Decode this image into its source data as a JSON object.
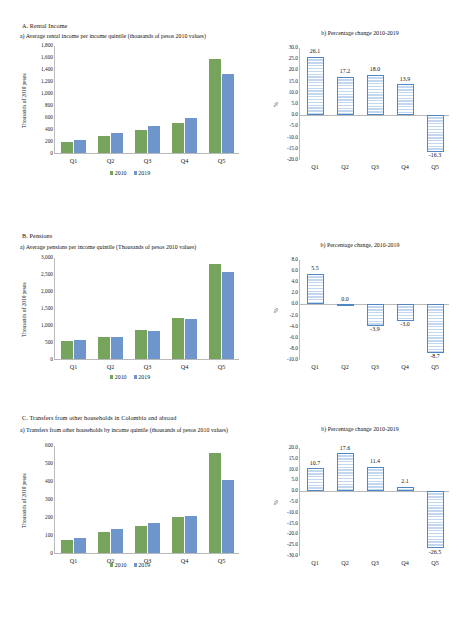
{
  "document": {
    "sections": [
      {
        "id": "rental-income",
        "heading": "A. Rental Income",
        "left_panel_title": "a) Average rental income per income quintile (thousands of pesos 2010 values)",
        "right_panel_title": "b) Percentage change 2010-2019",
        "legend": {
          "series1": "2010",
          "series2": "2019"
        }
      },
      {
        "id": "pensions",
        "heading": "B. Pensions",
        "left_panel_title": "a) Average pensions per income quintile (Thousands of pesos 2010 values)",
        "right_panel_title": "b) Percentage change, 2010-2019",
        "legend": {
          "series1": "2010",
          "series2": "2019"
        }
      },
      {
        "id": "transfers",
        "heading": "C. Transfers from other households in Colombia and abroad",
        "left_panel_title": "a) Transfers from other households by income quintile (thousands of pesos 2010 values)",
        "right_panel_title": "b) Percentage change 2010-2019",
        "legend": {
          "series1": "2010",
          "series2": "2019"
        }
      }
    ]
  },
  "colors": {
    "series_2010": "#76a45c",
    "series_2019": "#6e95cc",
    "pct_bar_border": "#4f86c6",
    "pct_bar_fill": "#eaf1fa",
    "axis": "#b9b9b9"
  },
  "chart_data": [
    {
      "id": "A-a",
      "type": "bar",
      "title": "a) Average rental income per income quintile (thousands of pesos 2010 values)",
      "xlabel": "",
      "ylabel": "Thousands of 2010 pesos",
      "categories": [
        "Q1",
        "Q2",
        "Q3",
        "Q4",
        "Q5"
      ],
      "series": [
        {
          "name": "2010",
          "values": [
            178,
            285,
            378,
            505,
            1560
          ]
        },
        {
          "name": "2019",
          "values": [
            225,
            335,
            448,
            578,
            1310
          ]
        }
      ],
      "ylim": [
        0,
        1800
      ],
      "yticks": [
        "0",
        "200",
        "400",
        "600",
        "800",
        "1,000",
        "1,200",
        "1,400",
        "1,600",
        "1,800"
      ],
      "grid": false,
      "legend_position": "bottom"
    },
    {
      "id": "A-b",
      "type": "bar",
      "title": "b) Percentage change 2010-2019",
      "xlabel": "",
      "ylabel": "%",
      "categories": [
        "Q1",
        "Q2",
        "Q3",
        "Q4",
        "Q5"
      ],
      "values": [
        26.1,
        17.2,
        18.0,
        13.9,
        -16.3
      ],
      "data_labels": [
        "26.1",
        "17.2",
        "18.0",
        "13.9",
        "-16.3"
      ],
      "ylim": [
        -20.0,
        30.0
      ],
      "yticks": [
        "30.0",
        "25.0",
        "20.0",
        "15.0",
        "10.0",
        "5.0",
        "0.0",
        "-5.0",
        "-10.0",
        "-15.0",
        "-20.0"
      ],
      "grid": false,
      "legend_position": "none"
    },
    {
      "id": "B-a",
      "type": "bar",
      "title": "a) Average pensions per income quintile (Thousands of pesos 2010 values)",
      "xlabel": "",
      "ylabel": "Thousands of 2010 pesos",
      "categories": [
        "Q1",
        "Q2",
        "Q3",
        "Q4",
        "Q5"
      ],
      "series": [
        {
          "name": "2010",
          "values": [
            530,
            660,
            850,
            1210,
            2790
          ]
        },
        {
          "name": "2019",
          "values": [
            560,
            660,
            815,
            1175,
            2545
          ]
        }
      ],
      "ylim": [
        0,
        3000
      ],
      "yticks": [
        "0",
        "500",
        "1,000",
        "1,500",
        "2,000",
        "2,500",
        "3,000"
      ],
      "grid": false,
      "legend_position": "bottom"
    },
    {
      "id": "B-b",
      "type": "bar",
      "title": "b) Percentage change, 2010-2019",
      "xlabel": "",
      "ylabel": "%",
      "categories": [
        "Q1",
        "Q2",
        "Q3",
        "Q4",
        "Q5"
      ],
      "values": [
        5.5,
        0.0,
        -3.9,
        -3.0,
        -8.7
      ],
      "data_labels": [
        "5.5",
        "0.0",
        "-3.9",
        "-3.0",
        "-8.7"
      ],
      "ylim": [
        -10.0,
        8.0
      ],
      "yticks": [
        "8.0",
        "6.0",
        "4.0",
        "2.0",
        "0.0",
        "-2.0",
        "-4.0",
        "-6.0",
        "-8.0",
        "-10.0"
      ],
      "grid": false,
      "legend_position": "none"
    },
    {
      "id": "C-a",
      "type": "bar",
      "title": "a) Transfers from other households by income quintile (thousands of pesos 2010 values)",
      "xlabel": "",
      "ylabel": "Thousands of 2010 pesos",
      "categories": [
        "Q1",
        "Q2",
        "Q3",
        "Q4",
        "Q5"
      ],
      "series": [
        {
          "name": "2010",
          "values": [
            73,
            117,
            148,
            201,
            553
          ]
        },
        {
          "name": "2019",
          "values": [
            82,
            135,
            166,
            206,
            403
          ]
        }
      ],
      "ylim": [
        0,
        600
      ],
      "yticks": [
        "0",
        "100",
        "200",
        "300",
        "400",
        "500",
        "600"
      ],
      "grid": false,
      "legend_position": "bottom"
    },
    {
      "id": "C-b",
      "type": "bar",
      "title": "b) Percentage change 2010-2019",
      "xlabel": "",
      "ylabel": "%",
      "categories": [
        "Q1",
        "Q2",
        "Q3",
        "Q4",
        "Q5"
      ],
      "values": [
        10.7,
        17.6,
        11.4,
        2.1,
        -26.5
      ],
      "data_labels": [
        "10.7",
        "17.6",
        "11.4",
        "2.1",
        "-26.5"
      ],
      "ylim": [
        -30.0,
        20.0
      ],
      "yticks": [
        "20.0",
        "15.0",
        "10.0",
        "5.0",
        "0.0",
        "-5.0",
        "-10.0",
        "-15.0",
        "-20.0",
        "-25.0",
        "-30.0"
      ],
      "grid": false,
      "legend_position": "none"
    }
  ]
}
